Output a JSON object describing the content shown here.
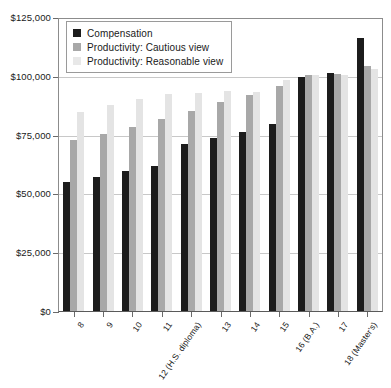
{
  "chart_data": {
    "type": "bar",
    "title": "",
    "subtitle": "",
    "xlabel": "",
    "ylabel": "",
    "grid": true,
    "legend_position": "top-left",
    "ylim": [
      0,
      125000
    ],
    "ytick_values": [
      0,
      25000,
      50000,
      75000,
      100000,
      125000
    ],
    "ytick_labels": [
      "$0",
      "$25,000",
      "$50,000",
      "$75,000",
      "$100,000",
      "$125,000"
    ],
    "categories": [
      "8",
      "9",
      "10",
      "11",
      "12 (H.S. diploma)",
      "13",
      "14",
      "15",
      "16 (B.A.)",
      "17",
      "18 (Master's)"
    ],
    "series": [
      {
        "name": "Compensation",
        "color": "#1c1c1c",
        "values": [
          54800,
          57000,
          59500,
          61500,
          70800,
          73500,
          76200,
          79500,
          99600,
          101200,
          116200
        ]
      },
      {
        "name": "Productivity: Cautious view",
        "color": "#a8a8a8",
        "values": [
          72600,
          75300,
          78200,
          81800,
          85200,
          88800,
          91800,
          95800,
          100200,
          100600,
          104000
        ]
      },
      {
        "name": "Productivity: Reasonable view",
        "color": "#e4e4e4",
        "values": [
          84500,
          87600,
          90100,
          92400,
          92600,
          93400,
          93200,
          98200,
          100300,
          100400,
          103000
        ]
      }
    ]
  },
  "legend": {
    "items": [
      {
        "label": "Compensation",
        "swatch": "legend-swatch-compensation"
      },
      {
        "label": "Productivity: Cautious view",
        "swatch": "legend-swatch-cautious"
      },
      {
        "label": "Productivity: Reasonable view",
        "swatch": "legend-swatch-reasonable"
      }
    ]
  }
}
